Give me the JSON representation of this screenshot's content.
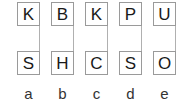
{
  "diagram": {
    "columns": [
      {
        "top": "K",
        "bottom": "S",
        "label": "a",
        "left": 17
      },
      {
        "top": "B",
        "bottom": "H",
        "label": "b",
        "left": 51
      },
      {
        "top": "K",
        "bottom": "C",
        "label": "c",
        "left": 85
      },
      {
        "top": "P",
        "bottom": "S",
        "label": "d",
        "left": 119
      },
      {
        "top": "U",
        "bottom": "O",
        "label": "e",
        "left": 153
      }
    ]
  }
}
